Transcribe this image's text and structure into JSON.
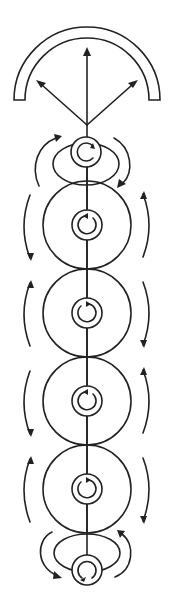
{
  "diagram": {
    "title": "Vertical chain of rotating ring elements with emitting arch",
    "colors": {
      "stroke": "#222222",
      "background": "#ffffff"
    },
    "emitter": {
      "shape": "semicircular arch",
      "arrows": [
        "up-left",
        "up",
        "up-right"
      ]
    },
    "nodes": [
      {
        "id": "top-node",
        "type": "small ring with ellipse",
        "inner_rotation": "clockwise",
        "side_arrows": {
          "left": "up",
          "right": "down"
        }
      },
      {
        "id": "disc-1",
        "type": "large circle with center ring",
        "inner_rotation": "clockwise",
        "side_arrows": {
          "left": "down",
          "right": "up"
        }
      },
      {
        "id": "disc-2",
        "type": "large circle with center ring",
        "inner_rotation": "counterclockwise",
        "side_arrows": {
          "left": "up",
          "right": "down"
        }
      },
      {
        "id": "disc-3",
        "type": "large circle with center ring",
        "inner_rotation": "clockwise",
        "side_arrows": {
          "left": "down",
          "right": "up"
        }
      },
      {
        "id": "disc-4",
        "type": "large circle with center ring",
        "inner_rotation": "counterclockwise",
        "side_arrows": {
          "left": "up",
          "right": "down"
        }
      },
      {
        "id": "bottom-node",
        "type": "small ring with ellipse",
        "inner_rotation": "counterclockwise",
        "side_arrows": {
          "left": "down",
          "right": "up"
        }
      }
    ]
  }
}
